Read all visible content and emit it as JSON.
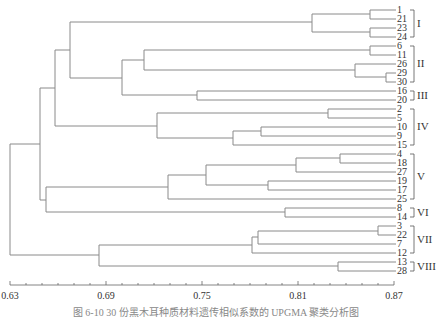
{
  "chart_data": {
    "type": "dendrogram",
    "title": "",
    "caption": "图 6-10  30 份黑木耳种质材料遗传相似系数的 UPGMA 聚类分析图",
    "xlabel": "",
    "x_axis": {
      "range": [
        0.63,
        0.87
      ],
      "major_ticks": [
        0.63,
        0.69,
        0.75,
        0.81,
        0.87
      ],
      "tick_labels": [
        "0.63",
        "0.69",
        "0.75",
        "0.81",
        "0.87"
      ],
      "minor_step": 0.01
    },
    "leaf_order": [
      "1",
      "21",
      "23",
      "24",
      "6",
      "11",
      "26",
      "29",
      "30",
      "16",
      "20",
      "2",
      "5",
      "10",
      "9",
      "15",
      "4",
      "18",
      "27",
      "19",
      "17",
      "25",
      "8",
      "14",
      "3",
      "22",
      "7",
      "12",
      "13",
      "28"
    ],
    "groups": [
      {
        "label": "I",
        "members": [
          "1",
          "21",
          "23",
          "24"
        ]
      },
      {
        "label": "II",
        "members": [
          "6",
          "11",
          "26",
          "29",
          "30"
        ]
      },
      {
        "label": "III",
        "members": [
          "16",
          "20"
        ]
      },
      {
        "label": "IV",
        "members": [
          "2",
          "5",
          "10",
          "9",
          "15"
        ]
      },
      {
        "label": "V",
        "members": [
          "4",
          "18",
          "27",
          "19",
          "17",
          "25"
        ]
      },
      {
        "label": "VI",
        "members": [
          "8",
          "14"
        ]
      },
      {
        "label": "VII",
        "members": [
          "3",
          "22",
          "7",
          "12"
        ]
      },
      {
        "label": "VIII",
        "members": [
          "13",
          "28"
        ]
      }
    ],
    "merges": [
      {
        "a": "1",
        "b": "21",
        "similarity": 0.853
      },
      {
        "a": "23",
        "b": "24",
        "similarity": 0.853
      },
      {
        "a": "(1,21)",
        "b": "(23,24)",
        "similarity": 0.818
      },
      {
        "a": "6",
        "b": "11",
        "similarity": 0.853
      },
      {
        "a": "29",
        "b": "30",
        "similarity": 0.865
      },
      {
        "a": "26",
        "b": "(29,30)",
        "similarity": 0.844
      },
      {
        "a": "(6,11)",
        "b": "(26,29,30)",
        "similarity": 0.703
      },
      {
        "a": "16",
        "b": "20",
        "similarity": 0.733
      },
      {
        "a": "(6,11,26,29,30)",
        "b": "(16,20)",
        "similarity": 0.687
      },
      {
        "a": "I",
        "b": "(II,III)",
        "similarity": 0.673
      },
      {
        "a": "2",
        "b": "5",
        "similarity": 0.798
      },
      {
        "a": "10",
        "b": "9",
        "similarity": 0.757
      },
      {
        "a": "(2,5)",
        "b": "(9,10,15)",
        "similarity": 0.716
      },
      {
        "a": "(I,II,III)",
        "b": "IV",
        "similarity": 0.655
      },
      {
        "a": "4",
        "b": "18",
        "similarity": 0.823
      },
      {
        "a": "(4,18)",
        "b": "27",
        "similarity": 0.793
      },
      {
        "a": "(4,18,27)",
        "b": "(19,17)",
        "similarity": 0.75
      },
      {
        "a": "(4,18,27,19,17)",
        "b": "25",
        "similarity": 0.733
      },
      {
        "a": "8",
        "b": "14",
        "similarity": 0.787
      },
      {
        "a": "V",
        "b": "VI",
        "similarity": 0.645
      },
      {
        "a": "(I..IV)",
        "b": "(V,VI)",
        "similarity": 0.643
      },
      {
        "a": "3",
        "b": "22",
        "similarity": 0.855
      },
      {
        "a": "(3,22)",
        "b": "7",
        "similarity": 0.75
      },
      {
        "a": "(3,22,7)",
        "b": "12",
        "similarity": 0.758
      },
      {
        "a": "13",
        "b": "28",
        "similarity": 0.83
      },
      {
        "a": "VII",
        "b": "VIII",
        "similarity": 0.688
      },
      {
        "a": "(I..VI)",
        "b": "(VII,VIII)",
        "similarity": 0.632
      }
    ]
  },
  "layout": {
    "x0": 10,
    "px_per_unit": 1600,
    "leaf_y": {
      "1": 10,
      "21": 19,
      "23": 28,
      "24": 37,
      "6": 46,
      "11": 55,
      "26": 64,
      "29": 73,
      "30": 82,
      "16": 91,
      "20": 100,
      "2": 109,
      "5": 118,
      "10": 127,
      "9": 136,
      "15": 145,
      "4": 154,
      "18": 163,
      "27": 172,
      "19": 181,
      "17": 190,
      "25": 199,
      "8": 208,
      "14": 217,
      "3": 226,
      "22": 235,
      "7": 244,
      "12": 253,
      "13": 262,
      "28": 271
    },
    "leaf_x": 370
  },
  "segments": [
    [
      370,
      10,
      396,
      10
    ],
    [
      370,
      19,
      396,
      19
    ],
    [
      370,
      10,
      370,
      19
    ],
    [
      370,
      28,
      396,
      28
    ],
    [
      370,
      37,
      396,
      37
    ],
    [
      370,
      28,
      370,
      37
    ],
    [
      312,
      14,
      370,
      14
    ],
    [
      312,
      32,
      370,
      32
    ],
    [
      312,
      14,
      312,
      32
    ],
    [
      370,
      46,
      396,
      46
    ],
    [
      370,
      55,
      396,
      55
    ],
    [
      370,
      46,
      370,
      55
    ],
    [
      386,
      73,
      396,
      73
    ],
    [
      386,
      82,
      396,
      82
    ],
    [
      386,
      73,
      386,
      82
    ],
    [
      355,
      64,
      396,
      64
    ],
    [
      355,
      77,
      386,
      77
    ],
    [
      355,
      64,
      355,
      77
    ],
    [
      144,
      50,
      370,
      50
    ],
    [
      144,
      70,
      355,
      70
    ],
    [
      144,
      50,
      144,
      70
    ],
    [
      197,
      91,
      396,
      91
    ],
    [
      197,
      100,
      396,
      100
    ],
    [
      197,
      91,
      197,
      100
    ],
    [
      122,
      60,
      144,
      60
    ],
    [
      122,
      95,
      197,
      95
    ],
    [
      122,
      60,
      122,
      95
    ],
    [
      70,
      22,
      312,
      22
    ],
    [
      70,
      78,
      122,
      78
    ],
    [
      70,
      22,
      70,
      78
    ],
    [
      328,
      109,
      396,
      109
    ],
    [
      328,
      118,
      396,
      118
    ],
    [
      328,
      109,
      328,
      118
    ],
    [
      261,
      127,
      396,
      127
    ],
    [
      261,
      136,
      396,
      136
    ],
    [
      261,
      127,
      261,
      136
    ],
    [
      233,
      131,
      261,
      131
    ],
    [
      233,
      145,
      396,
      145
    ],
    [
      233,
      131,
      233,
      145
    ],
    [
      157,
      113,
      328,
      113
    ],
    [
      157,
      138,
      233,
      138
    ],
    [
      157,
      113,
      157,
      138
    ],
    [
      55,
      50,
      70,
      50
    ],
    [
      55,
      126,
      157,
      126
    ],
    [
      55,
      50,
      55,
      126
    ],
    [
      340,
      154,
      396,
      154
    ],
    [
      340,
      163,
      396,
      163
    ],
    [
      340,
      154,
      340,
      163
    ],
    [
      296,
      158,
      340,
      158
    ],
    [
      296,
      172,
      396,
      172
    ],
    [
      296,
      158,
      296,
      172
    ],
    [
      268,
      181,
      396,
      181
    ],
    [
      268,
      190,
      396,
      190
    ],
    [
      268,
      181,
      268,
      190
    ],
    [
      206,
      165,
      296,
      165
    ],
    [
      206,
      185,
      268,
      185
    ],
    [
      206,
      165,
      206,
      185
    ],
    [
      168,
      175,
      206,
      175
    ],
    [
      168,
      199,
      396,
      199
    ],
    [
      168,
      175,
      168,
      199
    ],
    [
      285,
      208,
      396,
      208
    ],
    [
      285,
      217,
      396,
      217
    ],
    [
      285,
      208,
      285,
      217
    ],
    [
      46,
      187,
      168,
      187
    ],
    [
      46,
      212,
      285,
      212
    ],
    [
      46,
      187,
      46,
      212
    ],
    [
      40,
      88,
      55,
      88
    ],
    [
      40,
      200,
      46,
      200
    ],
    [
      40,
      88,
      40,
      200
    ],
    [
      378,
      226,
      396,
      226
    ],
    [
      378,
      235,
      396,
      235
    ],
    [
      378,
      226,
      378,
      235
    ],
    [
      258,
      231,
      378,
      231
    ],
    [
      258,
      244,
      396,
      244
    ],
    [
      258,
      231,
      258,
      244
    ],
    [
      252,
      237,
      258,
      237
    ],
    [
      252,
      253,
      396,
      253
    ],
    [
      252,
      237,
      252,
      253
    ],
    [
      338,
      262,
      396,
      262
    ],
    [
      338,
      271,
      396,
      271
    ],
    [
      338,
      262,
      338,
      271
    ],
    [
      99,
      245,
      252,
      245
    ],
    [
      99,
      266,
      338,
      266
    ],
    [
      99,
      245,
      99,
      266
    ],
    [
      10,
      144,
      40,
      144
    ],
    [
      10,
      255,
      99,
      255
    ],
    [
      10,
      144,
      10,
      255
    ]
  ],
  "group_brackets": [
    {
      "label": "I",
      "y1": 10,
      "y2": 37
    },
    {
      "label": "II",
      "y1": 46,
      "y2": 82
    },
    {
      "label": "III",
      "y1": 91,
      "y2": 100
    },
    {
      "label": "IV",
      "y1": 109,
      "y2": 145
    },
    {
      "label": "V",
      "y1": 154,
      "y2": 199
    },
    {
      "label": "VI",
      "y1": 208,
      "y2": 217
    },
    {
      "label": "VII",
      "y1": 226,
      "y2": 253
    },
    {
      "label": "VIII",
      "y1": 262,
      "y2": 271
    }
  ]
}
